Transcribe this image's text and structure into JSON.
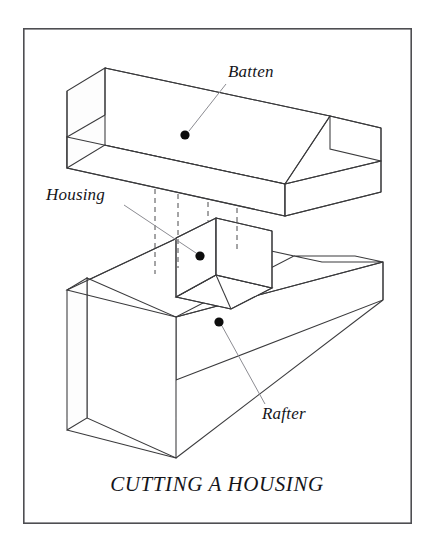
{
  "figure": {
    "caption": "CUTTING A HOUSING",
    "frame": {
      "x": 23,
      "y": 28,
      "width": 389,
      "height": 496,
      "stroke_color": "#4e4e52",
      "background_color": "#ffffff"
    },
    "style": {
      "line_color": "#3a3a3c",
      "hidden_line_color": "#4a4a4c",
      "leader_color": "#8c8c92",
      "dot_color": "#0d0d0d",
      "text_color": "#15151a"
    },
    "labels": [
      {
        "id": "batten",
        "text": "Batten",
        "text_x": 228,
        "text_y": 77,
        "anchor": "start",
        "dot_x": 185,
        "dot_y": 135,
        "leader_x1": 189,
        "leader_y1": 131,
        "leader_x2": 226,
        "leader_y2": 84
      },
      {
        "id": "housing",
        "text": "Housing",
        "text_x": 46,
        "text_y": 200,
        "anchor": "start",
        "dot_x": 200,
        "dot_y": 256,
        "leader_x1": 124,
        "leader_y1": 205,
        "leader_x2": 196,
        "leader_y2": 253
      },
      {
        "id": "rafter",
        "text": "Rafter",
        "text_x": 262,
        "text_y": 419,
        "anchor": "start",
        "dot_x": 219,
        "dot_y": 322,
        "leader_x1": 222,
        "leader_y1": 326,
        "leader_x2": 265,
        "leader_y2": 404
      }
    ],
    "caption_pos": {
      "x": 217,
      "y": 491
    },
    "parts": [
      {
        "id": "batten",
        "name": "Batten",
        "description": "Horizontal timber batten running across the rafter"
      },
      {
        "id": "rafter",
        "name": "Rafter",
        "description": "Upright timber rafter board with a cut housing"
      },
      {
        "id": "housing",
        "name": "Housing",
        "description": "Rectangular notch cut into the rafter to receive the batten"
      }
    ],
    "geometry": {
      "batten_top_face": "105,68 330,116 285,184 67,137",
      "batten_front_face": "67,137 285,184 285,216 67,168",
      "batten_left_end": "105,68 67,91 67,137 105,115",
      "batten_right_top": "330,116 381,128 381,160 285,184",
      "batten_right_end_face": "285,184 381,160 381,192 285,216",
      "rafter_top_left": "67,290 188,233 294,256 176,317",
      "rafter_front": "67,290 67,430 176,458 176,317",
      "rafter_left_end": "67,290 87,278 87,418 67,430",
      "rafter_big_face": "176,317 383,262 383,300 176,380",
      "notch_inner_left": "188,233 188,290 176,297 176,238",
      "notch_back": "188,233 243,244 243,300 188,290",
      "notch_floor": "176,290 232,302 271,281 215,268",
      "hidden_lines": [
        "155,153 155,273",
        "178,158 178,268",
        "208,165 208,232",
        "237,171 237,252"
      ]
    }
  }
}
